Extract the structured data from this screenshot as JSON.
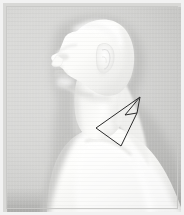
{
  "image": {
    "title": "Lateral profile of a pale mannequin bust with a hand-drawn quadrilateral annotation over the neck and clavicle region",
    "width": 184,
    "height": 215,
    "subject": "mannequin-bust-profile",
    "view": "left-lateral-profile",
    "caption": ""
  },
  "frame": {
    "border_color": "#f2f2f2",
    "border_line_color": "#c9c9c7",
    "border_width_px": 3
  },
  "backdrop": {
    "name": "studio-backdrop",
    "base_color": "#d2d2d0",
    "light_color": "#d8d8d6",
    "dark_color": "#c0c0be",
    "floor_band_color": "#9a9a98"
  },
  "subject": {
    "name": "mannequin-bust",
    "skin_highlight": "#ffffff",
    "skin_base": "#f6f6f4",
    "skin_shadow": "#e2e2e0",
    "skin_deep_shadow": "#cdcdcb",
    "parts": [
      {
        "name": "cranium",
        "label": "Cranium"
      },
      {
        "name": "face-profile",
        "label": "Face profile"
      },
      {
        "name": "nose",
        "label": "Nose"
      },
      {
        "name": "lips",
        "label": "Lips"
      },
      {
        "name": "chin",
        "label": "Chin"
      },
      {
        "name": "ear",
        "label": "Ear"
      },
      {
        "name": "neck",
        "label": "Neck"
      },
      {
        "name": "trapezius",
        "label": "Trapezius"
      },
      {
        "name": "clavicle",
        "label": "Clavicle"
      },
      {
        "name": "shoulder",
        "label": "Shoulder"
      },
      {
        "name": "chest",
        "label": "Chest"
      },
      {
        "name": "upper-arm",
        "label": "Upper arm"
      }
    ]
  },
  "annotation": {
    "name": "region-of-interest-quadrilateral",
    "type": "polygon",
    "stroke_color": "#2a2a2a",
    "stroke_width": 1,
    "fill": "none",
    "label": "",
    "points": [
      {
        "x": 137,
        "y": 94
      },
      {
        "x": 134,
        "y": 110
      },
      {
        "x": 118,
        "y": 143
      },
      {
        "x": 93,
        "y": 125
      }
    ],
    "notch": {
      "name": "fold-notch",
      "points": [
        {
          "x": 137,
          "y": 94
        },
        {
          "x": 122,
          "y": 112
        },
        {
          "x": 134,
          "y": 110
        }
      ]
    }
  }
}
